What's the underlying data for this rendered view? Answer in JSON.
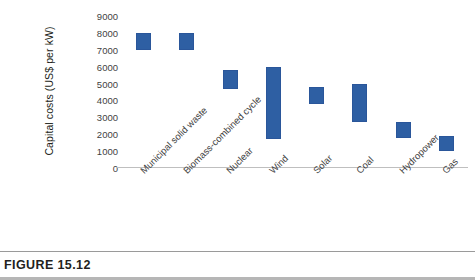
{
  "figure": {
    "caption_label": "FIGURE 15.12"
  },
  "chart_data": {
    "type": "bar",
    "bar_style": "floating-range",
    "title": "",
    "xlabel": "",
    "ylabel": "Capital costs (US$ per kW)",
    "ylim": [
      0,
      9000
    ],
    "ytick_step": 1000,
    "yticks": [
      "9000",
      "8000",
      "7000",
      "6000",
      "5000",
      "4000",
      "3000",
      "2000",
      "1000",
      "0"
    ],
    "grid": false,
    "legend": "none",
    "series_color": "#2e5fa3",
    "categories": [
      "Municipal solid waste",
      "Biomass-combined cycle",
      "Nuclear",
      "Wind",
      "Solar",
      "Coal",
      "Hydropower",
      "Gas"
    ],
    "low": [
      7000,
      7000,
      4700,
      1700,
      3800,
      2700,
      1800,
      1000
    ],
    "high": [
      8000,
      8000,
      5800,
      6000,
      4800,
      5000,
      2700,
      1900
    ],
    "series": [
      {
        "name": "low",
        "values": [
          7000,
          7000,
          4700,
          1700,
          3800,
          2700,
          1800,
          1000
        ]
      },
      {
        "name": "high",
        "values": [
          8000,
          8000,
          5800,
          6000,
          4800,
          5000,
          2700,
          1900
        ]
      }
    ]
  }
}
